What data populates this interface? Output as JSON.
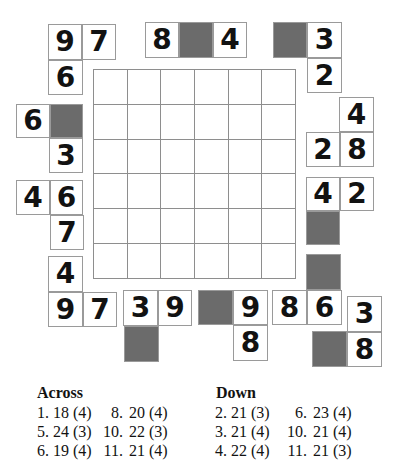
{
  "colors": {
    "shaded": "#6b6b6b",
    "cellBorder": "#9a9a9a",
    "gridLine": "#8e8e8e",
    "ink": "#121212"
  },
  "puzzle": {
    "grid": {
      "rows": 6,
      "cols": 6,
      "left": 93,
      "top": 69,
      "width": 202,
      "height": 209
    },
    "outer_cells": [
      {
        "value": "9",
        "x": 48,
        "y": 24,
        "w": 34,
        "h": 36,
        "shaded": false
      },
      {
        "value": "7",
        "x": 82,
        "y": 24,
        "w": 34,
        "h": 36,
        "shaded": false
      },
      {
        "value": "6",
        "x": 48,
        "y": 60,
        "w": 35,
        "h": 35,
        "shaded": false
      },
      {
        "value": "8",
        "x": 145,
        "y": 22,
        "w": 34,
        "h": 36,
        "shaded": false
      },
      {
        "value": "",
        "x": 179,
        "y": 22,
        "w": 34,
        "h": 36,
        "shaded": true
      },
      {
        "value": "4",
        "x": 213,
        "y": 22,
        "w": 34,
        "h": 36,
        "shaded": false
      },
      {
        "value": "",
        "x": 273,
        "y": 22,
        "w": 34,
        "h": 36,
        "shaded": true
      },
      {
        "value": "3",
        "x": 307,
        "y": 22,
        "w": 35,
        "h": 36,
        "shaded": false
      },
      {
        "value": "2",
        "x": 307,
        "y": 58,
        "w": 35,
        "h": 35,
        "shaded": false
      },
      {
        "value": "6",
        "x": 16,
        "y": 104,
        "w": 34,
        "h": 34,
        "shaded": false
      },
      {
        "value": "",
        "x": 50,
        "y": 104,
        "w": 33,
        "h": 34,
        "shaded": true
      },
      {
        "value": "3",
        "x": 49,
        "y": 138,
        "w": 34,
        "h": 35,
        "shaded": false
      },
      {
        "value": "4",
        "x": 16,
        "y": 180,
        "w": 34,
        "h": 35,
        "shaded": false
      },
      {
        "value": "6",
        "x": 50,
        "y": 180,
        "w": 33,
        "h": 35,
        "shaded": false
      },
      {
        "value": "7",
        "x": 50,
        "y": 215,
        "w": 34,
        "h": 35,
        "shaded": false
      },
      {
        "value": "4",
        "x": 48,
        "y": 256,
        "w": 35,
        "h": 36,
        "shaded": false
      },
      {
        "value": "9",
        "x": 48,
        "y": 292,
        "w": 35,
        "h": 35,
        "shaded": false
      },
      {
        "value": "7",
        "x": 83,
        "y": 292,
        "w": 34,
        "h": 35,
        "shaded": false
      },
      {
        "value": "3",
        "x": 123,
        "y": 290,
        "w": 35,
        "h": 36,
        "shaded": false
      },
      {
        "value": "9",
        "x": 158,
        "y": 290,
        "w": 34,
        "h": 36,
        "shaded": false
      },
      {
        "value": "",
        "x": 124,
        "y": 326,
        "w": 35,
        "h": 36,
        "shaded": true
      },
      {
        "value": "",
        "x": 198,
        "y": 290,
        "w": 35,
        "h": 35,
        "shaded": true
      },
      {
        "value": "9",
        "x": 233,
        "y": 290,
        "w": 35,
        "h": 35,
        "shaded": false
      },
      {
        "value": "8",
        "x": 233,
        "y": 325,
        "w": 35,
        "h": 36,
        "shaded": false
      },
      {
        "value": "8",
        "x": 272,
        "y": 290,
        "w": 35,
        "h": 35,
        "shaded": false
      },
      {
        "value": "6",
        "x": 307,
        "y": 290,
        "w": 35,
        "h": 35,
        "shaded": false
      },
      {
        "value": "3",
        "x": 347,
        "y": 296,
        "w": 35,
        "h": 36,
        "shaded": false
      },
      {
        "value": "",
        "x": 312,
        "y": 331,
        "w": 35,
        "h": 36,
        "shaded": true
      },
      {
        "value": "8",
        "x": 347,
        "y": 332,
        "w": 35,
        "h": 35,
        "shaded": false
      },
      {
        "value": "4",
        "x": 339,
        "y": 97,
        "w": 35,
        "h": 35,
        "shaded": false
      },
      {
        "value": "2",
        "x": 306,
        "y": 132,
        "w": 34,
        "h": 35,
        "shaded": false
      },
      {
        "value": "8",
        "x": 340,
        "y": 132,
        "w": 34,
        "h": 35,
        "shaded": false
      },
      {
        "value": "4",
        "x": 306,
        "y": 177,
        "w": 34,
        "h": 34,
        "shaded": false
      },
      {
        "value": "2",
        "x": 340,
        "y": 177,
        "w": 34,
        "h": 34,
        "shaded": false
      },
      {
        "value": "",
        "x": 306,
        "y": 211,
        "w": 34,
        "h": 34,
        "shaded": true
      },
      {
        "value": "",
        "x": 306,
        "y": 254,
        "w": 35,
        "h": 36,
        "shaded": true
      }
    ]
  },
  "clues": {
    "across": {
      "title": "Across",
      "items": [
        {
          "num": "1.",
          "text": "18 (4)"
        },
        {
          "num": "5.",
          "text": "24 (3)"
        },
        {
          "num": "6.",
          "text": "19 (4)"
        },
        {
          "num": "8.",
          "text": "20 (4)"
        },
        {
          "num": "10.",
          "text": "22 (3)"
        },
        {
          "num": "11.",
          "text": "21 (4)"
        }
      ]
    },
    "down": {
      "title": "Down",
      "items": [
        {
          "num": "2.",
          "text": "21 (3)"
        },
        {
          "num": "3.",
          "text": "21 (4)"
        },
        {
          "num": "4.",
          "text": "22 (4)"
        },
        {
          "num": "6.",
          "text": "23 (4)"
        },
        {
          "num": "10.",
          "text": "21 (4)"
        },
        {
          "num": "11.",
          "text": "21 (3)"
        }
      ]
    }
  }
}
